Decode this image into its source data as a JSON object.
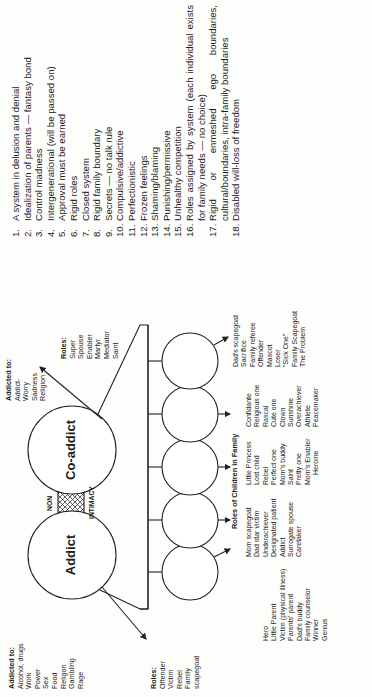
{
  "diagram": {
    "center_labels": {
      "addict": "Addict",
      "coaddict": "Co-addict",
      "non": "NON",
      "intimacy": "INTIMACY"
    },
    "addict_addictions": {
      "title": "Addicted to:",
      "items": [
        "Alcohol, drugs",
        "Work",
        "Power",
        "Sex",
        "Food",
        "Religon",
        "Gambling",
        "Rage"
      ]
    },
    "addict_roles": {
      "title": "Roles:",
      "items": [
        "Offender",
        "Victim",
        "Rebel",
        "Family",
        "scapegoat"
      ]
    },
    "coaddict_addictions": {
      "title": "Addicted to:",
      "items": [
        "Addict-",
        "Worry",
        "Sadness",
        "Religion"
      ]
    },
    "coaddict_roles": {
      "title": "Roles:",
      "items": [
        "Super",
        "Spouse",
        "Enabler",
        "Martyr",
        "Mediator",
        "Saint"
      ]
    },
    "children_title": "Roles of Children in Family",
    "children_columns": [
      [
        "Hero",
        "Little Parent",
        "Victim (physical illness)",
        "Parents' parent",
        "Dad's buddy",
        "Family counselor",
        "Winner",
        "Genius"
      ],
      [
        "Mom scapegoat",
        "Dad star victim",
        "Underachiever",
        "Designated patient",
        "Addict",
        "Surrogate spouse",
        "Caretaker"
      ],
      [
        "Little Princess",
        "Lost child",
        "Rebel",
        "Perfect one",
        "Mom's buddy",
        "Saint",
        "Pretty one",
        "Mom's Enabler",
        "Heroine"
      ],
      [
        "Confidante",
        "Religious one",
        "Rascal",
        "Cute one",
        "Clown",
        "Sunshine",
        "Overachiever",
        "Athlete",
        "Peacemaker"
      ],
      [
        "Dad's scapegoat",
        "Sacrifice",
        "Family referee",
        "Offender",
        "Mascot",
        "Loser",
        "\"Sick One\"",
        "Family Scapegoat",
        "The Problem"
      ]
    ]
  },
  "characteristics": [
    {
      "n": "1.",
      "t": "A system in delusion and denial"
    },
    {
      "n": "2.",
      "t": "Idealization of parents — fantasy bond"
    },
    {
      "n": "3.",
      "t": "Control madness"
    },
    {
      "n": "4.",
      "t": "Intergenerational (will be passed on)"
    },
    {
      "n": "5.",
      "t": "Approval must be earned"
    },
    {
      "n": "6.",
      "t": "Rigid roles"
    },
    {
      "n": "7.",
      "t": "Closed system"
    },
    {
      "n": "8.",
      "t": "Rigid family boundary"
    },
    {
      "n": "9.",
      "t": "Secrets — no talk rule"
    },
    {
      "n": "10.",
      "t": "Compulsive/addictive"
    },
    {
      "n": "11.",
      "t": "Perfectionistic"
    },
    {
      "n": "12.",
      "t": "Frozen feelings"
    },
    {
      "n": "13.",
      "t": "Shaming/blaming"
    },
    {
      "n": "14.",
      "t": "Punishing/permissive"
    },
    {
      "n": "15.",
      "t": "Unhealthy competition"
    },
    {
      "n": "16.",
      "t": "Roles assigned by system (each individual exists for family needs — no choice)"
    },
    {
      "n": "17.",
      "t": "Rigid or enmeshed ego boundaries, cultural/boundaries, intra-family boundaries"
    },
    {
      "n": "18.",
      "t": "Disabled will-loss of freedom"
    }
  ]
}
